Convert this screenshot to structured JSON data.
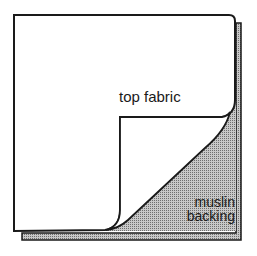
{
  "diagram": {
    "labels": {
      "top_fabric": "top fabric",
      "muslin_line1": "muslin",
      "muslin_line2": "backing"
    },
    "colors": {
      "outline": "#1a1a1a",
      "fabric": "#ffffff",
      "backing_hatch": "#9a9a9a"
    }
  }
}
